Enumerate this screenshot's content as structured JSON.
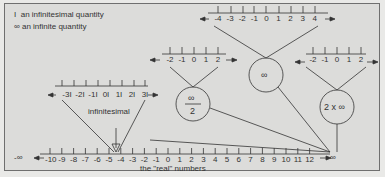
{
  "legend": {
    "items": [
      {
        "symbol": "I",
        "text": "an infinitesimal quantity"
      },
      {
        "symbol": "∞",
        "text": "an infinite quantity"
      }
    ]
  },
  "main_axis": {
    "left_end": "-∞",
    "right_end": "∞",
    "ticks": [
      "-10",
      "-9",
      "-8",
      "-7",
      "-6",
      "-5",
      "-4",
      "-3",
      "-2",
      "-1",
      "0",
      "1",
      "2",
      "3",
      "4",
      "5",
      "6",
      "7",
      "8",
      "9",
      "10",
      "11",
      "12"
    ],
    "caption": "the \"real\" numbers"
  },
  "infinitesimal_zoom": {
    "label": "infinitesimal",
    "ticks": [
      "-3I",
      "-2I",
      "-1I",
      "0I",
      "1I",
      "2I",
      "3I"
    ]
  },
  "infinite_zoom": {
    "circle_label": "∞",
    "ticks": [
      "-4",
      "-3",
      "-2",
      "-1",
      "0",
      "1",
      "2",
      "3",
      "4"
    ]
  },
  "half_infinite_zoom": {
    "circle_numerator": "∞",
    "circle_denominator": "2",
    "ticks": [
      "-2",
      "-1",
      "0",
      "1",
      "2"
    ]
  },
  "double_infinite_zoom": {
    "circle_label": "2 x ∞",
    "ticks": [
      "-2",
      "-1",
      "0",
      "1",
      "2"
    ]
  }
}
